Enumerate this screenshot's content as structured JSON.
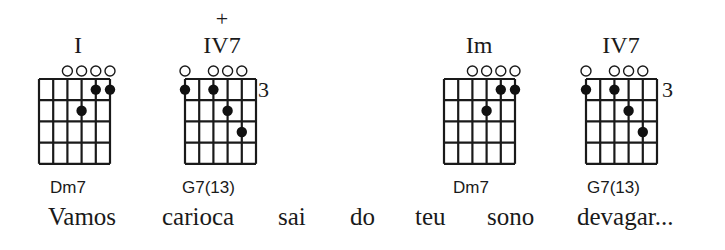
{
  "chords": [
    {
      "degree": "I",
      "accidental": "",
      "name": "Dm7",
      "fret_label": "",
      "open_strings": [
        3,
        4,
        5,
        6
      ],
      "dots": [
        {
          "string": 5,
          "fret": 1
        },
        {
          "string": 6,
          "fret": 1
        },
        {
          "string": 4,
          "fret": 2
        }
      ]
    },
    {
      "degree": "IV7",
      "accidental": "+",
      "name": "G7(13)",
      "fret_label": "3",
      "open_strings": [
        1,
        3,
        4,
        5
      ],
      "dots": [
        {
          "string": 1,
          "fret": 1
        },
        {
          "string": 3,
          "fret": 1
        },
        {
          "string": 4,
          "fret": 2
        },
        {
          "string": 5,
          "fret": 3
        }
      ]
    },
    {
      "degree": "Im",
      "accidental": "",
      "name": "Dm7",
      "fret_label": "",
      "open_strings": [
        3,
        4,
        5,
        6
      ],
      "dots": [
        {
          "string": 5,
          "fret": 1
        },
        {
          "string": 6,
          "fret": 1
        },
        {
          "string": 4,
          "fret": 2
        }
      ]
    },
    {
      "degree": "IV7",
      "accidental": "",
      "name": "G7(13)",
      "fret_label": "3",
      "open_strings": [
        1,
        3,
        4,
        5
      ],
      "dots": [
        {
          "string": 1,
          "fret": 1
        },
        {
          "string": 3,
          "fret": 1
        },
        {
          "string": 4,
          "fret": 2
        },
        {
          "string": 5,
          "fret": 3
        }
      ]
    }
  ],
  "lyrics": [
    "Vamos",
    "carioca",
    "sai",
    "do",
    "teu",
    "sono",
    "devagar..."
  ]
}
